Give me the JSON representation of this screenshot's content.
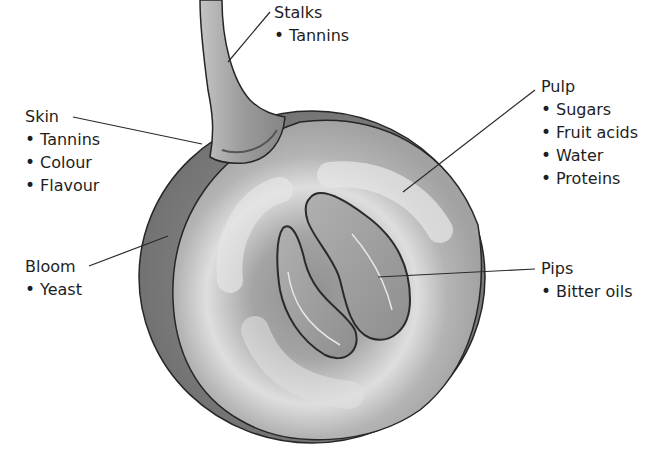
{
  "diagram": {
    "colors": {
      "skin_outer": "#7d7d7d",
      "pulp": "#a9a9a9",
      "pulp_highlight": "#dcdcdc",
      "stalk": "#9a9a9a",
      "outline": "#262626",
      "leader_line": "#2a2a2a",
      "text": "#1e1e1e"
    },
    "labels": {
      "stalks": {
        "title": "Stalks",
        "items": [
          "Tannins"
        ]
      },
      "skin": {
        "title": "Skin",
        "items": [
          "Tannins",
          "Colour",
          "Flavour"
        ]
      },
      "pulp": {
        "title": "Pulp",
        "items": [
          "Sugars",
          "Fruit acids",
          "Water",
          "Proteins"
        ]
      },
      "bloom": {
        "title": "Bloom",
        "items": [
          "Yeast"
        ]
      },
      "pips": {
        "title": "Pips",
        "items": [
          "Bitter oils"
        ]
      }
    }
  }
}
